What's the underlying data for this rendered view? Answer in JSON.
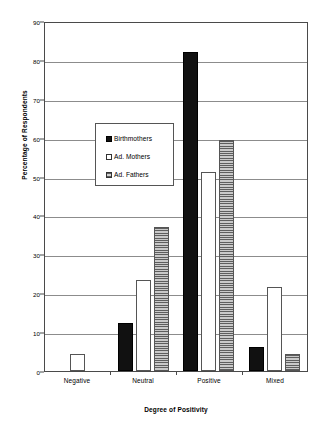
{
  "chart_data": {
    "type": "bar",
    "title": "",
    "xlabel": "Degree of Positivity",
    "ylabel": "Percentage of Respondents",
    "ylim": [
      0,
      90
    ],
    "ytick_step": 10,
    "yticks": [
      0,
      10,
      20,
      30,
      40,
      50,
      60,
      70,
      80,
      90
    ],
    "grid": true,
    "legend_position": "upper-left-inside",
    "categories": [
      "Negative",
      "Neutral",
      "Positive",
      "Mixed"
    ],
    "series": [
      {
        "name": "Birthmothers",
        "fill": "solid-black",
        "color": "#111111",
        "values": [
          0,
          12.3,
          82,
          6.3
        ]
      },
      {
        "name": "Ad. Mothers",
        "fill": "white-outline",
        "color": "#ffffff",
        "values": [
          4.5,
          23.5,
          51.3,
          21.7
        ]
      },
      {
        "name": "Ad. Fathers",
        "fill": "horizontal-hatch",
        "color": "#9a9a9a",
        "values": [
          0,
          37,
          59.5,
          4.5
        ]
      }
    ]
  },
  "axis": {
    "y_title": "Percentage of Respondents",
    "x_title": "Degree of Positivity"
  }
}
